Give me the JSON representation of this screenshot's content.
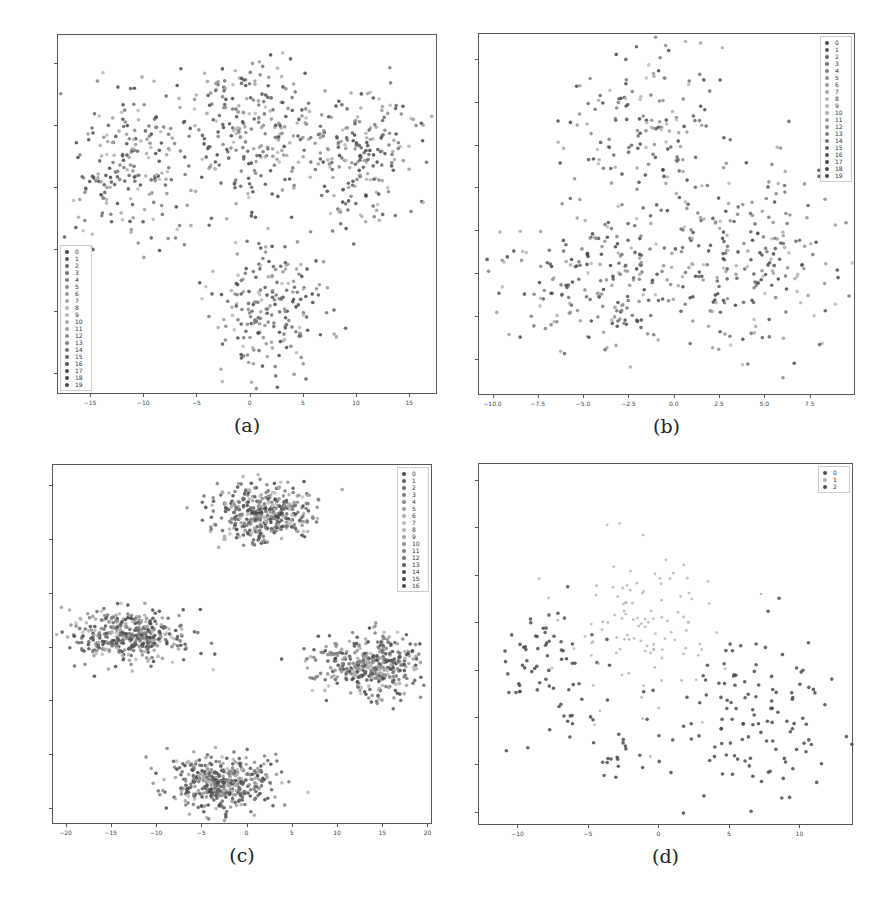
{
  "chart_data": [
    {
      "id": "a",
      "type": "scatter",
      "caption": "(a)",
      "frame": {
        "left": 57,
        "top": 34,
        "right": 437,
        "bottom": 394
      },
      "xlim": [
        -18.1,
        17.6
      ],
      "ylim": [
        -16.7,
        12.3
      ],
      "x_ticks": [
        -15,
        -10,
        -5,
        0,
        5,
        10,
        15
      ],
      "y_ticks": [
        10,
        5,
        0,
        -5,
        -10,
        -15
      ],
      "x_tick_labels": [
        "−15",
        "−10",
        "−5",
        "0",
        "5",
        "10",
        "15"
      ],
      "y_tick_labels": [
        "10",
        "5",
        "0",
        "−5",
        "−10",
        "−15"
      ],
      "legend": {
        "position": "lower left",
        "entries": [
          "0",
          "1",
          "2",
          "3",
          "4",
          "5",
          "6",
          "7",
          "8",
          "9",
          "10",
          "11",
          "12",
          "13",
          "14",
          "15",
          "16",
          "17",
          "18",
          "19"
        ]
      },
      "clusters": [
        {
          "cx": -11,
          "cy": 2,
          "sx": 3.0,
          "sy": 3.3,
          "n": 210
        },
        {
          "cx": 0,
          "cy": 5,
          "sx": 3.0,
          "sy": 3.2,
          "n": 230
        },
        {
          "cx": 10,
          "cy": 2.5,
          "sx": 3.0,
          "sy": 3.0,
          "n": 220
        },
        {
          "cx": 1.5,
          "cy": -9.5,
          "sx": 2.7,
          "sy": 2.8,
          "n": 210
        }
      ],
      "seed": 11
    },
    {
      "id": "b",
      "type": "scatter",
      "caption": "(b)",
      "frame": {
        "left": 478,
        "top": 33,
        "right": 855,
        "bottom": 395
      },
      "xlim": [
        -10.8,
        10.0
      ],
      "ylim": [
        -9.6,
        11.5
      ],
      "x_ticks": [
        -10,
        -7.5,
        -5,
        -2.5,
        0,
        2.5,
        5,
        7.5
      ],
      "y_ticks": [
        10,
        7.5,
        5,
        2.5,
        0,
        -2.5,
        -5,
        -7.5
      ],
      "x_tick_labels": [
        "−10.0",
        "−7.5",
        "−5.0",
        "−2.5",
        "0.0",
        "2.5",
        "5.0",
        "7.5"
      ],
      "y_tick_labels": [
        "10.0",
        "7.5",
        "5.0",
        "2.5",
        "0.0",
        "−2.5",
        "−5.0",
        "−7.5"
      ],
      "legend": {
        "position": "upper right",
        "entries": [
          "0",
          "1",
          "2",
          "3",
          "4",
          "5",
          "6",
          "7",
          "8",
          "9",
          "10",
          "11",
          "12",
          "13",
          "14",
          "15",
          "16",
          "17",
          "18",
          "19"
        ]
      },
      "clusters": [
        {
          "cx": -1.5,
          "cy": 6.0,
          "sx": 2.2,
          "sy": 2.2,
          "n": 150
        },
        {
          "cx": -4.5,
          "cy": -3.0,
          "sx": 2.6,
          "sy": 2.2,
          "n": 200
        },
        {
          "cx": 4.0,
          "cy": -1.5,
          "sx": 2.5,
          "sy": 3.0,
          "n": 240
        }
      ],
      "seed": 23
    },
    {
      "id": "c",
      "type": "scatter",
      "caption": "(c)",
      "frame": {
        "left": 52,
        "top": 464,
        "right": 432,
        "bottom": 824
      },
      "xlim": [
        -21.5,
        20.5
      ],
      "ylim": [
        -33.0,
        34.0
      ],
      "x_ticks": [
        -20,
        -15,
        -10,
        -5,
        0,
        5,
        10,
        15,
        20
      ],
      "y_ticks": [
        30,
        20,
        10,
        0,
        -10,
        -20,
        -30
      ],
      "x_tick_labels": [
        "−20",
        "−15",
        "−10",
        "−5",
        "0",
        "5",
        "10",
        "15",
        "20"
      ],
      "y_tick_labels": [
        "30",
        "20",
        "10",
        "0",
        "−10",
        "−20",
        "−30"
      ],
      "legend": {
        "position": "upper right",
        "entries": [
          "0",
          "1",
          "2",
          "3",
          "4",
          "5",
          "6",
          "7",
          "8",
          "9",
          "10",
          "11",
          "12",
          "13",
          "14",
          "15",
          "16"
        ]
      },
      "clusters": [
        {
          "cx": 2.0,
          "cy": 25.0,
          "sx": 2.8,
          "sy": 2.6,
          "n": 420
        },
        {
          "cx": -13.0,
          "cy": 2.0,
          "sx": 3.3,
          "sy": 2.3,
          "n": 400
        },
        {
          "cx": 13.5,
          "cy": -3.5,
          "sx": 2.8,
          "sy": 2.8,
          "n": 400
        },
        {
          "cx": -3.0,
          "cy": -25.0,
          "sx": 2.8,
          "sy": 2.5,
          "n": 420
        }
      ],
      "seed": 37
    },
    {
      "id": "d",
      "type": "scatter",
      "caption": "(d)",
      "frame": {
        "left": 478,
        "top": 463,
        "right": 853,
        "bottom": 825
      },
      "xlim": [
        -12.8,
        13.8
      ],
      "ylim": [
        -8.2,
        10.9
      ],
      "x_ticks": [
        -10,
        -5,
        0,
        5,
        10
      ],
      "y_ticks": [
        10,
        7.5,
        5,
        2.5,
        0,
        -2.5,
        -5,
        -7.5
      ],
      "x_tick_labels": [
        "−10",
        "−5",
        "0",
        "5",
        "10"
      ],
      "y_tick_labels": [
        "10.0",
        "7.5",
        "5.0",
        "2.5",
        "0.0",
        "−2.5",
        "−5.0",
        "−7.5"
      ],
      "legend": {
        "position": "upper right",
        "entries": [
          "0",
          "1",
          "2"
        ]
      },
      "clusters": [
        {
          "cx": -8.0,
          "cy": 0.3,
          "sx": 2.2,
          "sy": 1.9,
          "n": 70,
          "class": 0
        },
        {
          "cx": -1.0,
          "cy": 2.0,
          "sx": 3.0,
          "sy": 2.3,
          "n": 110,
          "class": 1
        },
        {
          "cx": 7.5,
          "cy": -2.5,
          "sx": 3.0,
          "sy": 2.3,
          "n": 120,
          "class": 2
        },
        {
          "cx": -2.5,
          "cy": -4.5,
          "sx": 2.0,
          "sy": 1.5,
          "n": 30,
          "class": 2
        }
      ],
      "seed": 53
    }
  ],
  "palette": {
    "dark_marker": "#4a4a4a",
    "light_marker": "#b4b4b4",
    "frame": "#555555",
    "text": "#333333"
  }
}
